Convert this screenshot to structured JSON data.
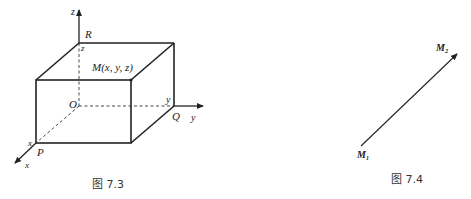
{
  "figures": [
    {
      "id": "fig-7-3",
      "caption": "图 7.3",
      "labels": {
        "z_axis": "z",
        "y_axis": "y",
        "x_axis": "x",
        "origin": "O",
        "R": "R",
        "Q": "Q",
        "P": "P",
        "z_coord": "z",
        "y_coord": "y",
        "x_coord": "x",
        "point": "M(x, y, z)"
      }
    },
    {
      "id": "fig-7-4",
      "caption": "图 7.4",
      "labels": {
        "start": "M",
        "start_sub": "1",
        "end": "M",
        "end_sub": "2"
      }
    }
  ],
  "colors": {
    "line": "#222222",
    "text": "#222222",
    "background": "#ffffff"
  }
}
